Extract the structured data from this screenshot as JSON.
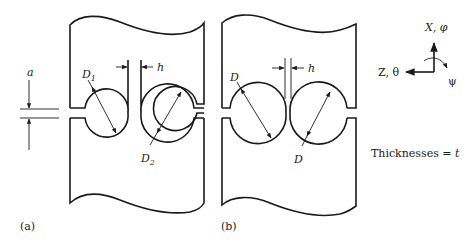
{
  "figure": {
    "panel_a": {
      "label": "(a)",
      "dim_a": "a",
      "dim_h": "h",
      "diameter_1": "D",
      "diameter_1_sub": "1",
      "diameter_2": "D",
      "diameter_2_sub": "2"
    },
    "panel_b": {
      "label": "(b)",
      "dim_h": "h",
      "diameter_1": "D",
      "diameter_2": "D"
    },
    "axes": {
      "x_label": "X, φ",
      "z_label": "Z, θ",
      "rot_label": "ψ"
    },
    "note": {
      "prefix": "Thicknesses = ",
      "var": "t"
    },
    "colors": {
      "stroke": "#1a1a1a",
      "background": "#ffffff"
    }
  }
}
